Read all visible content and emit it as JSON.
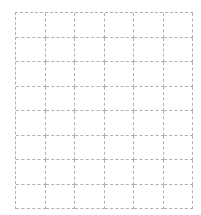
{
  "grid": {
    "columns": 6,
    "rows": 8,
    "line_color": "#b0b0b0",
    "line_style": "dashed",
    "background": "#ffffff",
    "cells": []
  }
}
